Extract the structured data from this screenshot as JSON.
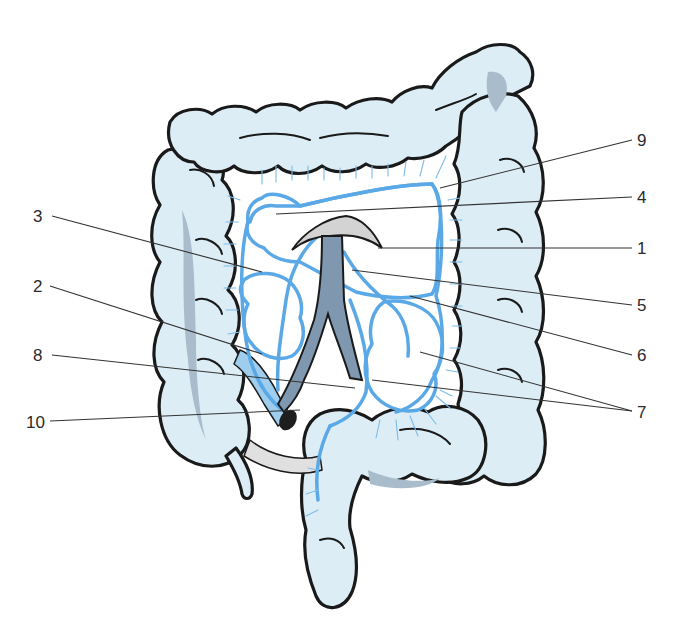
{
  "figure": {
    "colors": {
      "colon_fill": "#dcedf6",
      "colon_shadow": "#a9bccb",
      "vessel_blue": "#5aa9e6",
      "artery_gray": "#7f98b0",
      "outline": "#1a1a1a",
      "background": "#ffffff"
    }
  },
  "labels": {
    "left": [
      {
        "id": "3",
        "text": "3"
      },
      {
        "id": "2",
        "text": "2"
      },
      {
        "id": "8",
        "text": "8"
      },
      {
        "id": "10",
        "text": "10"
      }
    ],
    "right": [
      {
        "id": "9",
        "text": "9"
      },
      {
        "id": "4",
        "text": "4"
      },
      {
        "id": "1",
        "text": "1"
      },
      {
        "id": "5",
        "text": "5"
      },
      {
        "id": "6",
        "text": "6"
      },
      {
        "id": "7",
        "text": "7"
      }
    ]
  }
}
